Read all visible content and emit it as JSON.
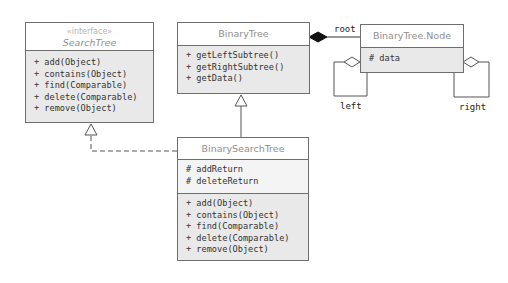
{
  "search_tree": {
    "stereotype": "«interface»",
    "name": "SearchTree",
    "methods": [
      "+ add(Object)",
      "+ contains(Object)",
      "+ find(Comparable)",
      "+ delete(Comparable)",
      "+ remove(Object)"
    ]
  },
  "binary_tree": {
    "name": "BinaryTree",
    "methods": [
      "+ getLeftSubtree()",
      "+ getRightSubtree()",
      "+ getData()"
    ]
  },
  "node": {
    "name": "BinaryTree.Node",
    "attributes": [
      "# data"
    ]
  },
  "binary_search_tree": {
    "name": "BinarySearchTree",
    "attributes": [
      "# addReturn",
      "# deleteReturn"
    ],
    "methods": [
      "+ add(Object)",
      "+ contains(Object)",
      "+ find(Comparable)",
      "+ delete(Comparable)",
      "+ remove(Object)"
    ]
  },
  "associations": {
    "root_label": "root",
    "left_label": "left",
    "right_label": "right"
  },
  "colors": {
    "border": "#6e6e6e",
    "header_text": "#8f8f8f",
    "method_fill": "#e9e9e9",
    "composition_diamond": "#111111"
  }
}
